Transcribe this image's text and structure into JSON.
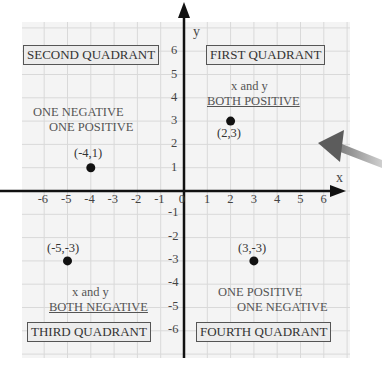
{
  "axes": {
    "x_label": "x",
    "y_label": "y",
    "x_ticks": [
      "-6",
      "-5",
      "-4",
      "-3",
      "-2",
      "-1",
      "0",
      "1",
      "2",
      "3",
      "4",
      "5",
      "6"
    ],
    "y_ticks_pos": [
      "1",
      "2",
      "3",
      "4",
      "5",
      "6"
    ],
    "y_ticks_neg": [
      "-1",
      "-2",
      "-3",
      "-4",
      "-5",
      "-6"
    ]
  },
  "quadrants": {
    "first": {
      "title": "FIRST QUADRANT",
      "line1": "x and y",
      "line2": "BOTH POSITIVE"
    },
    "second": {
      "title": "SECOND QUADRANT",
      "line1": "ONE NEGATIVE",
      "line2": "ONE POSITIVE"
    },
    "third": {
      "title": "THIRD QUADRANT",
      "line1": "x and y",
      "line2": "BOTH NEGATIVE"
    },
    "fourth": {
      "title": "FOURTH QUADRANT",
      "line1": "ONE POSITIVE",
      "line2": "ONE NEGATIVE"
    }
  },
  "points": [
    {
      "label": "(2,3)",
      "x": 2,
      "y": 3
    },
    {
      "label": "(-4,1)",
      "x": -4,
      "y": 1
    },
    {
      "label": "(-5,-3)",
      "x": -5,
      "y": -3
    },
    {
      "label": "(3,-3)",
      "x": 3,
      "y": -3
    }
  ],
  "colors": {
    "grid": "#d8d8d8",
    "background": "#f3f3f3",
    "axis": "#111111",
    "arrow": "#6a6a6a"
  }
}
